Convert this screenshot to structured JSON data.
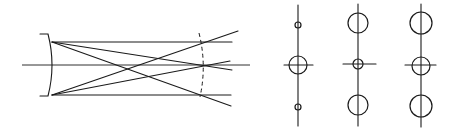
{
  "diagram": {
    "type": "optical ray diagram with spot diagrams",
    "colors": {
      "stroke": "#1a1a1a",
      "background": "#ffffff"
    },
    "ray_diagram": {
      "optical_axis": {
        "x1": 22,
        "x2": 250,
        "y": 65
      },
      "mirror": {
        "top": [
          50,
          34
        ],
        "bottom": [
          50,
          96
        ],
        "bulge_x": 53
      },
      "focal_surface": {
        "style": "dashed",
        "x_top": 199,
        "x_mid": 205,
        "x_bottom": 200
      },
      "rays": [
        {
          "from": [
            52,
            42
          ],
          "to": [
            232,
            42
          ]
        },
        {
          "from": [
            52,
            95
          ],
          "to": [
            231,
            95
          ]
        },
        {
          "from": [
            52,
            42
          ],
          "to": [
            232,
            70
          ]
        },
        {
          "from": [
            52,
            42
          ],
          "to": [
            231,
            106
          ]
        },
        {
          "from": [
            52,
            95
          ],
          "to": [
            238,
            31
          ]
        },
        {
          "from": [
            52,
            95
          ],
          "to": [
            230,
            61
          ]
        }
      ]
    },
    "spot_diagrams": [
      {
        "column": 1,
        "x": 298,
        "axis_y": [
          5,
          126
        ],
        "crossbar": {
          "x1": 284,
          "x2": 313,
          "y": 65
        },
        "spots": [
          {
            "y": 25,
            "r": 3
          },
          {
            "y": 65,
            "r": 9
          },
          {
            "y": 107,
            "r": 3
          }
        ]
      },
      {
        "column": 2,
        "x": 358,
        "axis_y": [
          4,
          126
        ],
        "crossbar": {
          "x1": 343,
          "x2": 376,
          "y": 64
        },
        "spots": [
          {
            "y": 23,
            "r": 10
          },
          {
            "y": 64,
            "r": 5
          },
          {
            "y": 105,
            "r": 10
          }
        ]
      },
      {
        "column": 3,
        "x": 421,
        "axis_y": [
          4,
          127
        ],
        "crossbar": {
          "x1": 405,
          "x2": 436,
          "y": 65
        },
        "spots": [
          {
            "y": 23,
            "r": 11
          },
          {
            "y": 66,
            "r": 9
          },
          {
            "y": 106,
            "r": 11
          }
        ]
      }
    ]
  }
}
